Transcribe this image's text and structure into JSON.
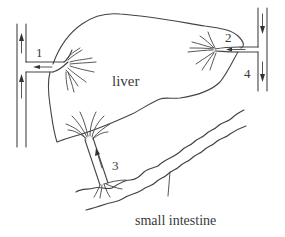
{
  "diagram": {
    "type": "anatomical-schematic",
    "organs": {
      "liver": "liver",
      "intestine": "small intestine"
    },
    "vessel_labels": {
      "v1": "1",
      "v2": "2",
      "v3": "3",
      "v4": "4"
    },
    "flows": [
      {
        "vessel": "1",
        "direction": "from liver leftward into vertical vessel, flowing upward"
      },
      {
        "vessel": "2",
        "direction": "from vertical vessel leftward into liver"
      },
      {
        "vessel": "3",
        "direction": "from small intestine upward into liver"
      },
      {
        "vessel": "4",
        "direction": "downward in vertical vessel on right"
      }
    ],
    "colors": {
      "stroke": "#444444",
      "text": "#3a3a3a",
      "background": "#ffffff"
    }
  }
}
